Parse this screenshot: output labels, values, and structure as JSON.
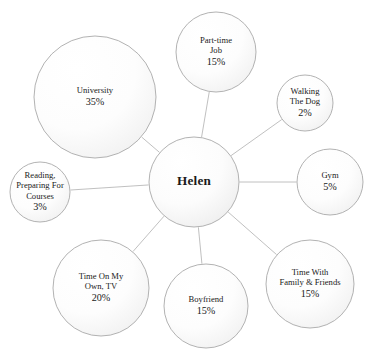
{
  "diagram": {
    "title": "Helen",
    "type": "bubble-network",
    "background_color": "#ffffff",
    "circle_stroke_color": "#a9a9a9",
    "connector_color": "#b9b9b9",
    "text_color": "#1a1a1a",
    "center": {
      "id": "helen",
      "label": "Helen",
      "cx": 194,
      "cy": 182,
      "r": 45
    },
    "nodes": [
      {
        "id": "university",
        "lines": [
          "University"
        ],
        "value": "35%",
        "percent": 35,
        "cx": 95,
        "cy": 97,
        "r": 61
      },
      {
        "id": "part-time-job",
        "lines": [
          "Part-time",
          "Job"
        ],
        "value": "15%",
        "percent": 15,
        "cx": 216,
        "cy": 52,
        "r": 40
      },
      {
        "id": "walking-the-dog",
        "lines": [
          "Walking",
          "The Dog"
        ],
        "value": "2%",
        "percent": 2,
        "cx": 305,
        "cy": 103,
        "r": 28
      },
      {
        "id": "gym",
        "lines": [
          "Gym"
        ],
        "value": "5%",
        "percent": 5,
        "cx": 330,
        "cy": 182,
        "r": 33
      },
      {
        "id": "time-with-family-friends",
        "lines": [
          "Time With",
          "Family & Friends"
        ],
        "value": "15%",
        "percent": 15,
        "cx": 310,
        "cy": 284,
        "r": 44
      },
      {
        "id": "boyfriend",
        "lines": [
          "Boyfriend"
        ],
        "value": "15%",
        "percent": 15,
        "cx": 206,
        "cy": 306,
        "r": 42
      },
      {
        "id": "time-on-my-own-tv",
        "lines": [
          "Time On My",
          "Own, TV"
        ],
        "value": "20%",
        "percent": 20,
        "cx": 101,
        "cy": 288,
        "r": 48
      },
      {
        "id": "reading-preparing-for-courses",
        "lines": [
          "Reading,",
          "Preparing For",
          "Courses"
        ],
        "value": "3%",
        "percent": 3,
        "cx": 40,
        "cy": 192,
        "r": 30
      }
    ]
  },
  "chart_data": {
    "type": "pie",
    "title": "Helen",
    "categories": [
      "University",
      "Part-time Job",
      "Walking The Dog",
      "Gym",
      "Time With Family & Friends",
      "Boyfriend",
      "Time On My Own, TV",
      "Reading, Preparing For Courses"
    ],
    "values": [
      35,
      15,
      2,
      5,
      15,
      15,
      20,
      3
    ],
    "value_labels": [
      "35%",
      "15%",
      "2%",
      "5%",
      "15%",
      "15%",
      "20%",
      "3%"
    ],
    "xlabel": "",
    "ylabel": "",
    "legend": "none",
    "grid": false
  }
}
